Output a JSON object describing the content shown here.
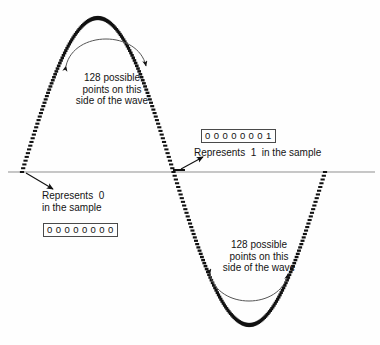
{
  "figure": {
    "background_color": "#fefefe",
    "ink_color": "#111111",
    "axis_color": "#8f8f8f"
  },
  "annotations": {
    "top_note": "128 possible\npoints on this\nside of the wave",
    "bottom_note": "128 possible\npoints on this\nside of the wave",
    "represents_one": "Represents  1  in the sample",
    "represents_zero": "Represents  0\nin the sample"
  },
  "bit_values": {
    "one_sample": "0 0 0 0 0 0 0 1",
    "zero_sample": "0 0 0 0 0 0 0 0"
  },
  "chart_data": {
    "type": "line",
    "xlabel": "",
    "ylabel": "",
    "grid": false,
    "legend": "none",
    "xlim": [
      0,
      1
    ],
    "ylim": [
      -1,
      1
    ],
    "series": [
      {
        "name": "sampled-sine-wave",
        "style": "dotted-sample-points",
        "description": "One full sine cycle drawn as a dense row of square sample dots; positive half-cycle on the left, negative half-cycle on the right.",
        "samples_per_half_cycle": 128,
        "zero_crossings_x": [
          0.0,
          0.5,
          1.0
        ],
        "peak": {
          "x": 0.25,
          "y": 1
        },
        "trough": {
          "x": 0.75,
          "y": -1
        }
      },
      {
        "name": "zero-axis",
        "style": "thin-solid-line",
        "values": [
          0,
          0
        ]
      }
    ]
  },
  "icons": {
    "curved_arrow_top": "double-headed-curved-arrow-down",
    "curved_arrow_bottom": "double-headed-curved-arrow-up",
    "pointer_zero": "arrow-down-right",
    "pointer_one": "arrow-up-right"
  }
}
